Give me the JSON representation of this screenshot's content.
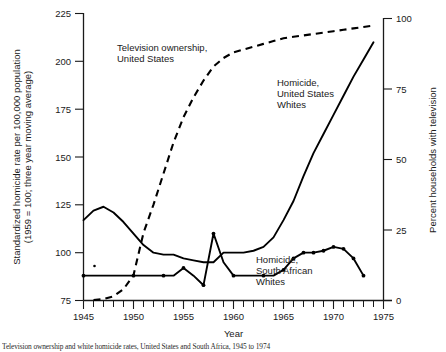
{
  "figure": {
    "caption": "Television ownership and white homicide rates, United States and South Africa, 1945 to 1974"
  },
  "chart_data": {
    "type": "line",
    "title": "",
    "xlabel": "Year",
    "ylabel": "Standardized homicide rate per 100,000 population (1959 = 100; three year moving average)",
    "y2label": "Percent households with television",
    "xlim": [
      1945,
      1975
    ],
    "ylim": [
      75,
      225
    ],
    "y2lim": [
      0,
      100
    ],
    "grid": false,
    "legend_position": "inline-annotations",
    "xticks": [
      1945,
      1950,
      1955,
      1960,
      1965,
      1970,
      1975
    ],
    "xtick_labels": [
      "1945",
      "1950",
      "1955",
      "1960",
      "1965",
      "1970",
      "1975"
    ],
    "xtick_minor_step": 1,
    "yticks": [
      75,
      100,
      125,
      150,
      175,
      200,
      225
    ],
    "ytick_labels": [
      "75",
      "100",
      "125",
      "150",
      "175",
      "200",
      "225"
    ],
    "y2ticks": [
      0,
      25,
      50,
      75,
      100
    ],
    "y2tick_labels": [
      "0",
      "25",
      "50",
      "75",
      "100"
    ],
    "annotations": [
      {
        "name": "television-ownership-label",
        "text": "Television ownership,\nUnited States",
        "lines": [
          "Television ownership,",
          "United States"
        ],
        "x": 1948.2,
        "y": 203
      },
      {
        "name": "homicide-us-whites-label",
        "text": "Homicide,\nUnited States\nWhites",
        "lines": [
          "Homicide,",
          "United States",
          "Whites"
        ],
        "x": 1960.6,
        "y": 192
      },
      {
        "name": "homicide-sa-whites-label",
        "text": "Homicide,\nSouth African\nWhites",
        "lines": [
          "Homicide,",
          "South African",
          "Whites"
        ],
        "x": 1959.0,
        "y": 95
      }
    ],
    "series": [
      {
        "name": "Television ownership, United States",
        "axis": "right",
        "style": "dashed",
        "units": "percent households with television",
        "x": [
          1946,
          1947,
          1948,
          1949,
          1950,
          1951,
          1952,
          1953,
          1954,
          1955,
          1956,
          1957,
          1958,
          1959,
          1960,
          1961,
          1962,
          1963,
          1964,
          1965,
          1966,
          1967,
          1968,
          1969,
          1970,
          1971,
          1972,
          1973,
          1974
        ],
        "values": [
          0.2,
          0.5,
          1.5,
          4,
          9,
          24,
          34,
          45,
          56,
          65,
          72,
          78,
          83,
          86,
          88,
          89,
          90,
          91,
          92,
          93,
          93.5,
          94,
          94.5,
          95,
          95.5,
          96,
          96.5,
          97,
          97.5
        ]
      },
      {
        "name": "Homicide, United States Whites",
        "axis": "left",
        "style": "solid",
        "units": "standardized homicide rate index (1959 = 100)",
        "x": [
          1945,
          1946,
          1947,
          1948,
          1949,
          1950,
          1951,
          1952,
          1953,
          1954,
          1955,
          1956,
          1957,
          1958,
          1959,
          1960,
          1961,
          1962,
          1963,
          1964,
          1965,
          1966,
          1967,
          1968,
          1969,
          1970,
          1971,
          1972,
          1973,
          1974
        ],
        "values": [
          117,
          122,
          124,
          121,
          116,
          110,
          104,
          100,
          99,
          99,
          97,
          96,
          95,
          95,
          100,
          100,
          100,
          101,
          103,
          108,
          117,
          127,
          140,
          152,
          162,
          172,
          182,
          192,
          201,
          210
        ]
      },
      {
        "name": "Homicide, South African Whites",
        "axis": "left",
        "style": "solid",
        "units": "standardized homicide rate index (1959 = 100)",
        "x": [
          1945,
          1946,
          1947,
          1948,
          1949,
          1950,
          1951,
          1952,
          1953,
          1954,
          1955,
          1956,
          1957,
          1958,
          1959,
          1960,
          1961,
          1962,
          1963,
          1964,
          1965,
          1966,
          1967,
          1968,
          1969,
          1970,
          1971,
          1972,
          1973
        ],
        "values": [
          88,
          88,
          88,
          88,
          88,
          88,
          88,
          88,
          88,
          88,
          92,
          88,
          83,
          110,
          95,
          88,
          88,
          88,
          88,
          88,
          91,
          97,
          100,
          100,
          101,
          103,
          102,
          97,
          88
        ]
      }
    ],
    "markers": {
      "series": "Homicide, South African Whites",
      "x": [
        1945,
        1950,
        1953,
        1955,
        1957,
        1958,
        1960,
        1963,
        1965,
        1966,
        1967,
        1968,
        1969,
        1970,
        1971,
        1972,
        1973
      ]
    },
    "stray_point": {
      "name": "stray-data-point",
      "x": 1946.1,
      "y": 93
    }
  }
}
